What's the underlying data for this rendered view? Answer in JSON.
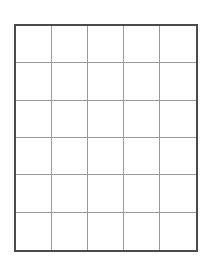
{
  "grid": {
    "columns": 5,
    "rows": 6,
    "outer_border_color": "#4a4a4a",
    "inner_line_color": "#9a9a9a",
    "background_color": "#ffffff",
    "cells": [
      [
        "",
        "",
        "",
        "",
        ""
      ],
      [
        "",
        "",
        "",
        "",
        ""
      ],
      [
        "",
        "",
        "",
        "",
        ""
      ],
      [
        "",
        "",
        "",
        "",
        ""
      ],
      [
        "",
        "",
        "",
        "",
        ""
      ],
      [
        "",
        "",
        "",
        "",
        ""
      ]
    ]
  }
}
